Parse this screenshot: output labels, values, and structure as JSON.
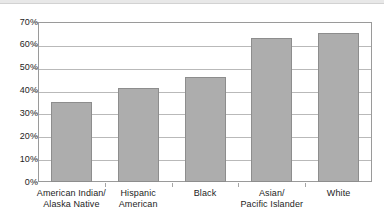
{
  "chart_data": {
    "type": "bar",
    "title": "",
    "subtitle": "",
    "xlabel": "",
    "ylabel": "",
    "categories": [
      "American Indian/\nAlaska Native",
      "Hispanic\nAmerican",
      "Black",
      "Asian/\nPacific Islander",
      "White"
    ],
    "category_lines": [
      [
        "American Indian/",
        "Alaska Native"
      ],
      [
        "Hispanic",
        "American"
      ],
      [
        "Black",
        ""
      ],
      [
        "Asian/",
        "Pacific Islander"
      ],
      [
        "White",
        ""
      ]
    ],
    "values": [
      35,
      41,
      46,
      63,
      65
    ],
    "value_labels": [
      "35%",
      "41%",
      "46%",
      "63%",
      "65%"
    ],
    "ylim": [
      0,
      70
    ],
    "ytick_values": [
      0,
      10,
      20,
      30,
      40,
      50,
      60,
      70
    ],
    "ytick_labels": [
      "0%",
      "10%",
      "20%",
      "30%",
      "40%",
      "50%",
      "60%",
      "70%"
    ],
    "grid": true,
    "legend": false,
    "legend_position": "none",
    "bar_color": "#adadad",
    "bar_border_color": "#8d8d8d",
    "grid_color": "#b9b9b9",
    "frame_color": "#9a9a9a",
    "text_color": "#1d1d1d",
    "background_color": "#ffffff"
  }
}
